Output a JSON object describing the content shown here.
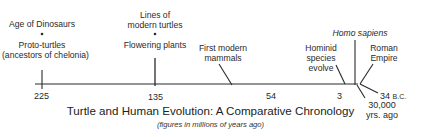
{
  "title": "Turtle and Human Evolution: A Comparative Chronology",
  "subtitle": "(figures in millions of years ago)",
  "events": {
    "e225": {
      "top": "Age of Dinosaurs",
      "bottom_1": "Proto-turtles",
      "bottom_2": "(ancestors of chelonia)"
    },
    "e135": {
      "top_1": "Lines of",
      "top_2": "modern turtles",
      "bottom": "Flowering plants"
    },
    "e54": {
      "line_1": "First modern",
      "line_2": "mammals"
    },
    "e3": {
      "line_1": "Hominid",
      "line_2": "species",
      "line_3": "evolve"
    },
    "homo": {
      "label": "Homo sapiens"
    },
    "roman": {
      "line_1": "Roman",
      "line_2": "Empire"
    }
  },
  "ticks": {
    "t225": "225",
    "t135": "135",
    "t54": "54",
    "t3": "3",
    "t34bc_num": "34",
    "t34bc_unit": "B.C.",
    "t30000_1": "30,000",
    "t30000_2": "yrs. ago"
  },
  "colors": {
    "ink": "#2a2a2a",
    "background": "#ffffff"
  }
}
